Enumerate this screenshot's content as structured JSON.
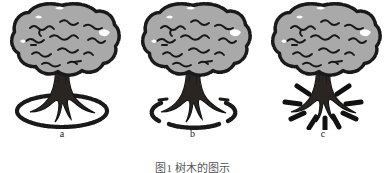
{
  "figure": {
    "caption": "图1  树木的图示",
    "background_color": "#ffffff",
    "canopy_fill": "#a9a9a9",
    "ink_color": "#1a1a1a",
    "trunk_fill": "#2a2520",
    "panels": [
      {
        "label": "a",
        "base_marking": "complete-ellipse",
        "base_marking_name": "unbroken ground ring around trunk"
      },
      {
        "label": "b",
        "base_marking": "broken-ellipse",
        "base_marking_name": "broken ground ring of arc segments around trunk"
      },
      {
        "label": "c",
        "base_marking": "radial-rays",
        "base_marking_name": "radial dashes radiating outward from trunk base"
      }
    ]
  }
}
